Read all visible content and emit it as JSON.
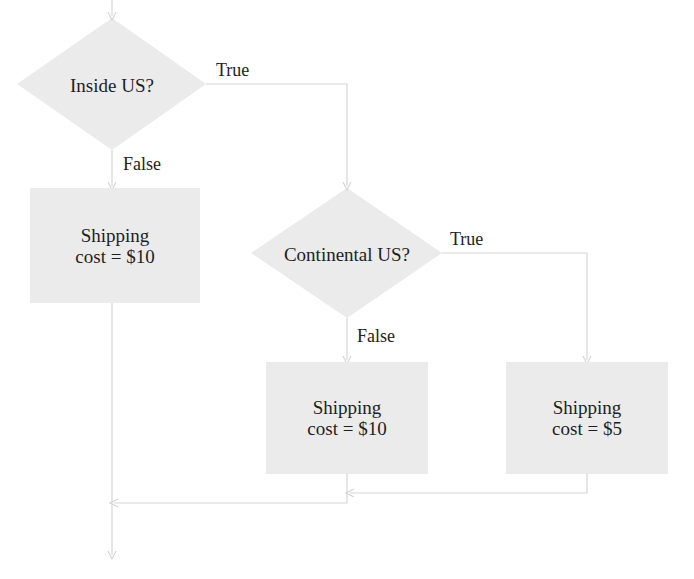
{
  "colors": {
    "node_fill": "#ebebeb",
    "connector": "#d6d6d6",
    "text": "#1e1e1e"
  },
  "nodes": {
    "decision_inside_us": {
      "label": "Inside US?"
    },
    "decision_continental_us": {
      "label": "Continental US?"
    },
    "shipping_outside_us": {
      "line1": "Shipping",
      "line2": "cost = $10"
    },
    "shipping_non_continental": {
      "line1": "Shipping",
      "line2": "cost = $10"
    },
    "shipping_continental": {
      "line1": "Shipping",
      "line2": "cost = $5"
    }
  },
  "edges": {
    "inside_us_true": "True",
    "inside_us_false": "False",
    "continental_true": "True",
    "continental_false": "False"
  }
}
